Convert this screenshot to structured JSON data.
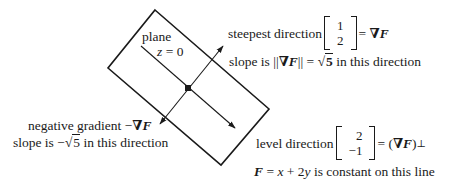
{
  "diagram": {
    "plane": {
      "label": "plane",
      "equation_lhs": "z",
      "equation_rest": " = 0",
      "corners": [
        [
          155,
          10
        ],
        [
          269,
          109
        ],
        [
          221,
          165
        ],
        [
          108,
          68
        ]
      ]
    },
    "center_point": [
      188,
      88
    ],
    "steepest": {
      "text": "steepest direction",
      "vector": [
        "1",
        "2"
      ],
      "equals": "=",
      "nabla": "∇",
      "F": "F",
      "slope_prefix": "slope is ||",
      "slope_mid": "|| = ",
      "slope_root": "5",
      "slope_suffix": " in this direction"
    },
    "negative": {
      "text": "negative gradient −",
      "nabla": "∇",
      "F": "F",
      "slope_prefix": "slope is −",
      "slope_root": "5",
      "slope_suffix": " in this direction"
    },
    "level": {
      "text": "level direction",
      "vector": [
        "2",
        "−1"
      ],
      "equals": "= (",
      "nabla": "∇",
      "F": "F",
      "close": ")",
      "perp": "⊥",
      "line_F": "F",
      "line_eq1": " = ",
      "line_x": "x",
      "line_eq2": " + 2",
      "line_y": "y",
      "line_suffix": " is constant on this line"
    },
    "sqrt_symbol": "√",
    "colors": {
      "ink": "#1a1a1a",
      "background": "#ffffff"
    }
  }
}
